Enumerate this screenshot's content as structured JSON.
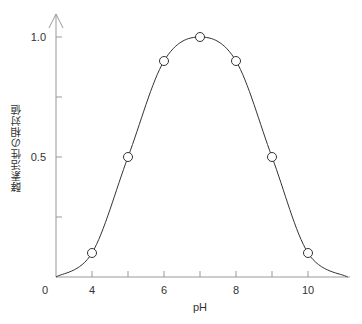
{
  "chart_data": {
    "type": "line",
    "title": "",
    "xlabel": "pH",
    "ylabel": "酵素活性の相対値",
    "x": [
      4,
      5,
      6,
      7,
      8,
      9,
      10
    ],
    "series": [
      {
        "name": "酵素活性",
        "values": [
          0.1,
          0.5,
          0.9,
          1.0,
          0.9,
          0.5,
          0.1
        ],
        "markers": "open-circle",
        "smooth": true
      }
    ],
    "x_ticks": [
      4,
      5,
      6,
      7,
      8,
      9,
      10
    ],
    "x_tick_labels": [
      "0",
      "4",
      "6",
      "8",
      "10"
    ],
    "y_ticks": [
      0.25,
      0.5,
      0.75,
      1.0
    ],
    "y_tick_labels": [
      "0.5",
      "1.0"
    ],
    "xlim": [
      3,
      11.2
    ],
    "ylim": [
      0,
      1.05
    ],
    "grid": false,
    "legend": null,
    "origin_label": "0",
    "curve_extent": {
      "start": {
        "x": 3,
        "y": 0
      },
      "end": {
        "x": 11.1,
        "y": 0
      }
    }
  },
  "labels": {
    "origin": "0",
    "x4": "4",
    "x6": "6",
    "x8": "8",
    "x10": "10",
    "y05": "0.5",
    "y10": "1.0",
    "xlabel": "pH",
    "ylabel": "酵素活性の相対値"
  },
  "colors": {
    "axis": "#999999",
    "curve": "#333333",
    "marker_fill": "#ffffff",
    "marker_stroke": "#333333"
  }
}
